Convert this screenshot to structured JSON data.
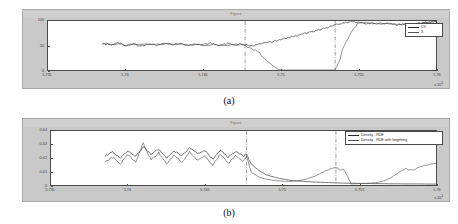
{
  "figure": {
    "caption_a": "(a)",
    "caption_b": "(b)",
    "window_title_a": "Figure",
    "window_title_b": "Figure"
  },
  "chart_data": [
    {
      "id": "panel-a",
      "type": "line",
      "title": "Figure",
      "caption": "(a)",
      "xlabel": "",
      "ylabel": "",
      "x_exponent": "x 10",
      "x_exponent_sup": "4",
      "xlim": [
        5.735,
        5.76
      ],
      "ylim": [
        0,
        100
      ],
      "xticks": [
        "5.735",
        "5.74",
        "5.745",
        "5.75",
        "5.755",
        "5.76"
      ],
      "xtick_values": [
        5.735,
        5.74,
        5.745,
        5.75,
        5.755,
        5.76
      ],
      "yticks": [
        "100",
        "50",
        "0"
      ],
      "ytick_values": [
        100,
        50,
        0
      ],
      "grid": false,
      "legend_position": "top-right",
      "annotations": [
        {
          "type": "vline",
          "style": "dash-dot",
          "x": 5.7477
        },
        {
          "type": "vline",
          "style": "dash-dot",
          "x": 5.7535
        }
      ],
      "series": [
        {
          "name": "CV",
          "color": "#2a2a2a",
          "x": [
            5.7385,
            5.739,
            5.7395,
            5.74,
            5.7405,
            5.741,
            5.7415,
            5.742,
            5.7425,
            5.743,
            5.7435,
            5.744,
            5.7445,
            5.745,
            5.7455,
            5.746,
            5.7465,
            5.747,
            5.7475,
            5.748,
            5.7485,
            5.749,
            5.7495,
            5.75,
            5.7505,
            5.751,
            5.7515,
            5.752,
            5.7525,
            5.753,
            5.7535,
            5.754,
            5.7545,
            5.755,
            5.7555,
            5.756,
            5.7565,
            5.757,
            5.7575,
            5.758,
            5.7585,
            5.759,
            5.7595,
            5.76
          ],
          "y": [
            54,
            51,
            55,
            50,
            53,
            49,
            54,
            50,
            55,
            51,
            54,
            50,
            53,
            52,
            55,
            50,
            54,
            51,
            53,
            49,
            52,
            55,
            58,
            62,
            66,
            70,
            74,
            78,
            82,
            86,
            92,
            96,
            99,
            97,
            94,
            96,
            93,
            95,
            92,
            94,
            93,
            96,
            98,
            99
          ]
        },
        {
          "name": "X",
          "color": "#555555",
          "x": [
            5.7385,
            5.74,
            5.742,
            5.744,
            5.746,
            5.7477,
            5.7485,
            5.749,
            5.7495,
            5.7498,
            5.75,
            5.7535,
            5.7538,
            5.754,
            5.7545,
            5.755,
            5.756,
            5.757,
            5.758,
            5.759,
            5.76
          ],
          "y": [
            54,
            51,
            53,
            52,
            51,
            50,
            38,
            22,
            8,
            2,
            0,
            0,
            20,
            45,
            75,
            97,
            95,
            94,
            93,
            96,
            99
          ]
        }
      ]
    },
    {
      "id": "panel-b",
      "type": "line",
      "title": "Figure",
      "caption": "(b)",
      "xlabel": "",
      "ylabel": "",
      "x_exponent": "x 10",
      "x_exponent_sup": "4",
      "xlim": [
        5.735,
        5.76
      ],
      "ylim": [
        0,
        0.04
      ],
      "xticks": [
        "5.735",
        "5.74",
        "5.745",
        "5.75",
        "5.755",
        "5.76"
      ],
      "xtick_values": [
        5.735,
        5.74,
        5.745,
        5.75,
        5.755,
        5.76
      ],
      "yticks": [
        "0.04",
        "0.03",
        "0.02",
        "0.01",
        "0"
      ],
      "ytick_values": [
        0.04,
        0.03,
        0.02,
        0.01,
        0
      ],
      "grid": false,
      "legend_position": "top-right",
      "annotations": [
        {
          "type": "vline",
          "style": "dash-dot",
          "x": 5.7477
        },
        {
          "type": "vline",
          "style": "dash-dot",
          "x": 5.7535
        }
      ],
      "series": [
        {
          "name": "Density - RDE",
          "color": "#2a2a2a",
          "x": [
            5.7385,
            5.739,
            5.7395,
            5.74,
            5.7405,
            5.741,
            5.7415,
            5.742,
            5.7425,
            5.743,
            5.7435,
            5.744,
            5.7445,
            5.745,
            5.7455,
            5.746,
            5.7465,
            5.747,
            5.7475,
            5.7477,
            5.748,
            5.7485,
            5.749,
            5.7495,
            5.75,
            5.7505,
            5.751,
            5.7515,
            5.752,
            5.7525,
            5.753,
            5.7535,
            5.754,
            5.7545,
            5.755,
            5.7555,
            5.756,
            5.7565,
            5.757,
            5.7575,
            5.758,
            5.7585,
            5.759,
            5.7595,
            5.76
          ],
          "y": [
            0.0215,
            0.0245,
            0.0195,
            0.0255,
            0.021,
            0.0285,
            0.023,
            0.0265,
            0.02,
            0.025,
            0.0215,
            0.0275,
            0.0235,
            0.0255,
            0.019,
            0.026,
            0.0205,
            0.0245,
            0.0215,
            0.023,
            0.0155,
            0.0105,
            0.0075,
            0.0058,
            0.0045,
            0.0036,
            0.003,
            0.0026,
            0.0022,
            0.002,
            0.0018,
            0.0016,
            0.0014,
            0.0013,
            0.0012,
            0.0011,
            0.001,
            0.001,
            0.0009,
            0.0009,
            0.0008,
            0.0008,
            0.0008,
            0.0007,
            0.0007
          ]
        },
        {
          "name": "Density - RDE with forgetting",
          "color": "#555555",
          "x": [
            5.7385,
            5.739,
            5.7395,
            5.74,
            5.7405,
            5.741,
            5.7415,
            5.742,
            5.7425,
            5.743,
            5.7435,
            5.744,
            5.7445,
            5.745,
            5.7455,
            5.746,
            5.7465,
            5.747,
            5.7475,
            5.7477,
            5.748,
            5.7485,
            5.749,
            5.7495,
            5.75,
            5.7505,
            5.751,
            5.7515,
            5.752,
            5.7525,
            5.753,
            5.7532,
            5.7535,
            5.7538,
            5.754,
            5.7545,
            5.755,
            5.7555,
            5.756,
            5.7565,
            5.757,
            5.7575,
            5.758,
            5.7585,
            5.759,
            5.7595,
            5.76
          ],
          "y": [
            0.017,
            0.0205,
            0.0155,
            0.023,
            0.017,
            0.031,
            0.0185,
            0.024,
            0.0155,
            0.0225,
            0.017,
            0.0245,
            0.0185,
            0.0215,
            0.0145,
            0.023,
            0.016,
            0.0215,
            0.0175,
            0.0215,
            0.0095,
            0.0058,
            0.0042,
            0.0034,
            0.0028,
            0.0026,
            0.003,
            0.0042,
            0.006,
            0.0085,
            0.011,
            0.0125,
            0.0128,
            0.011,
            0.0118,
            0.0008,
            0.001,
            0.0012,
            0.0016,
            0.0026,
            0.0048,
            0.0088,
            0.012,
            0.0108,
            0.0135,
            0.015,
            0.016
          ]
        }
      ]
    }
  ],
  "panel_a": {
    "legend": [
      {
        "label": "CV"
      },
      {
        "label": "X"
      }
    ]
  },
  "panel_b": {
    "legend": [
      {
        "label": "Density - RDE"
      },
      {
        "label": "Density - RDE with forgetting"
      }
    ]
  }
}
